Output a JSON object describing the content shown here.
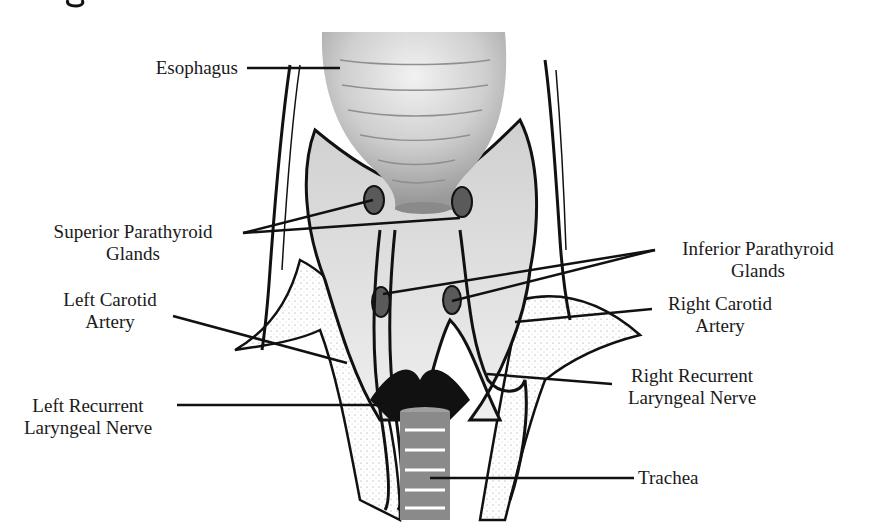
{
  "diagram": {
    "title_fragment": "g",
    "labels": {
      "esophagus": {
        "line1": "Esophagus"
      },
      "superior_parathyroid": {
        "line1": "Superior Parathyroid",
        "line2": "Glands"
      },
      "inferior_parathyroid": {
        "line1": "Inferior Parathyroid",
        "line2": "Glands"
      },
      "left_carotid": {
        "line1": "Left Carotid",
        "line2": "Artery"
      },
      "right_carotid": {
        "line1": "Right Carotid",
        "line2": "Artery"
      },
      "left_recurrent": {
        "line1": "Left Recurrent",
        "line2": "Laryngeal Nerve"
      },
      "right_recurrent": {
        "line1": "Right Recurrent",
        "line2": "Laryngeal Nerve"
      },
      "trachea": {
        "line1": "Trachea"
      }
    },
    "colors": {
      "ink": "#111111",
      "esophagus_fill": "#bdbdbd",
      "esophagus_highlight": "#eeeeee",
      "thyroid_fill": "#d6d6d6",
      "gland_fill": "#5a5a5a",
      "trachea_fill": "#8a8a8a",
      "vessel_fill": "#f4f4f4"
    }
  }
}
